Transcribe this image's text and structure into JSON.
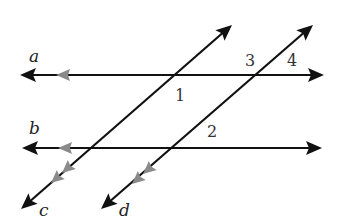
{
  "diagram": {
    "type": "parallel lines cut by transversals",
    "colors": {
      "line": "#111111",
      "parallel_marker": "#8a8a8a",
      "background": "#ffffff"
    },
    "lines": [
      {
        "id": "a",
        "label": "a",
        "kind": "horizontal",
        "parallel_markers": 1
      },
      {
        "id": "b",
        "label": "b",
        "kind": "horizontal",
        "parallel_markers": 1
      },
      {
        "id": "c",
        "label": "c",
        "kind": "transversal",
        "parallel_markers": 2
      },
      {
        "id": "d",
        "label": "d",
        "kind": "transversal",
        "parallel_markers": 2
      }
    ],
    "angles": [
      {
        "id": "1",
        "label": "1",
        "at": "intersection of a and c"
      },
      {
        "id": "2",
        "label": "2",
        "at": "intersection of b and d"
      },
      {
        "id": "3",
        "label": "3",
        "at": "intersection of a and d"
      },
      {
        "id": "4",
        "label": "4",
        "at": "intersection of a and d"
      }
    ]
  }
}
